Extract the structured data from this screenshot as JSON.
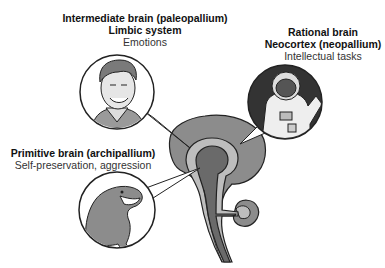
{
  "diagram": {
    "labels": {
      "intermediate": {
        "line1": "Intermediate brain (paleopallium)",
        "line2": "Limbic system",
        "line3": "Emotions"
      },
      "rational": {
        "line1": "Rational brain",
        "line2": "Neocortex (neopallium)",
        "line3": "Intellectual tasks"
      },
      "primitive": {
        "line1": "Primitive brain (archipallium)",
        "line2": "Self-preservation, aggression"
      }
    },
    "illustrations": {
      "intermediate": "human-face",
      "rational": "astronaut",
      "primitive": "lizard"
    },
    "colors": {
      "neocortex": "#8c8c8c",
      "limbic": "#bdbdbd",
      "primitive": "#6a6a6a",
      "outline": "#222222",
      "astronaut_bg": "#333333"
    }
  }
}
